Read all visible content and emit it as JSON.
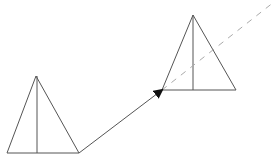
{
  "diagram": {
    "width": 276,
    "height": 160,
    "colors": {
      "background": "#ffffff",
      "stroke": "#555555",
      "dashed": "#aaaaaa",
      "arrowhead": "#111111"
    },
    "shapes": [
      {
        "id": "left-triangle",
        "type": "triangle",
        "apex": [
          36,
          76
        ],
        "base_left": [
          7,
          153
        ],
        "base_right": [
          79,
          153
        ],
        "median_x": 37
      },
      {
        "id": "right-triangle",
        "type": "triangle",
        "apex": [
          193,
          15
        ],
        "base_left": [
          162,
          90
        ],
        "base_right": [
          236,
          90
        ],
        "median_x": 193
      }
    ],
    "arrow": {
      "from": [
        79,
        153
      ],
      "to": [
        162,
        90
      ],
      "head": "filled-triangle"
    },
    "dashed_line": {
      "from": [
        162,
        90
      ],
      "to": [
        274,
        2
      ]
    }
  }
}
